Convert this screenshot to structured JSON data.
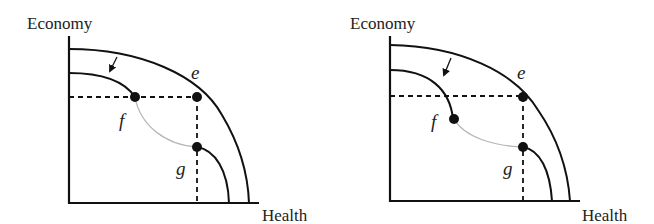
{
  "figure": {
    "panels": [
      {
        "id": "left",
        "y_axis_label": "Economy",
        "x_axis_label": "Health",
        "points": [
          {
            "name": "e",
            "label": "e"
          },
          {
            "name": "f",
            "label": "f"
          },
          {
            "name": "g",
            "label": "g"
          }
        ],
        "description": "Outer PPF contracts to inner curve; f lies on horizontal dashed line at economy level of e; g lies on vertical dashed line at health level of e; gray curve connects f and g"
      },
      {
        "id": "right",
        "y_axis_label": "Economy",
        "x_axis_label": "Health",
        "points": [
          {
            "name": "e",
            "label": "e"
          },
          {
            "name": "f",
            "label": "f"
          },
          {
            "name": "g",
            "label": "g"
          }
        ],
        "description": "Outer PPF contracts to inner curve; f lies below the horizontal dashed line at economy level of e; g lies on vertical dashed line at health level of e; gray curve connects f and g"
      }
    ],
    "colors": {
      "line": "#111111",
      "connector": "#b5b5b5",
      "background": "#ffffff"
    }
  }
}
